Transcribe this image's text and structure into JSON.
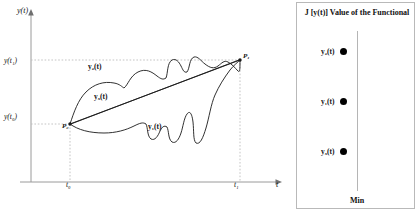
{
  "diagram": {
    "y_axis_label": "y(t)",
    "t_axis_label": "t",
    "y_ticks": [
      {
        "label": "y(t₁)"
      },
      {
        "label": "y(t₀)"
      }
    ],
    "t_ticks": [
      {
        "label": "t₀"
      },
      {
        "label": "t₁"
      }
    ],
    "points": [
      {
        "label": "P₀"
      },
      {
        "label": "P₁"
      }
    ],
    "curves": [
      {
        "name": "upper-curve",
        "label": "y₂(t)"
      },
      {
        "name": "straight-line",
        "label": "y₃(t)"
      },
      {
        "name": "lower-curve",
        "label": "y₁(t)"
      }
    ],
    "colors": {
      "stroke": "#1a1a1a",
      "axis": "#9a9a9a",
      "guide": "#bdbdbd"
    }
  },
  "functional": {
    "title": "J [y(t)] Value of the Functional",
    "min_label": "Min",
    "entries": [
      {
        "label": "y₂(t)"
      },
      {
        "label": "y₁(t)"
      },
      {
        "label": "y₃(t)"
      }
    ],
    "colors": {
      "dot": "#000000",
      "axis": "#b5b5b5",
      "border": "#b9b9b9"
    }
  }
}
